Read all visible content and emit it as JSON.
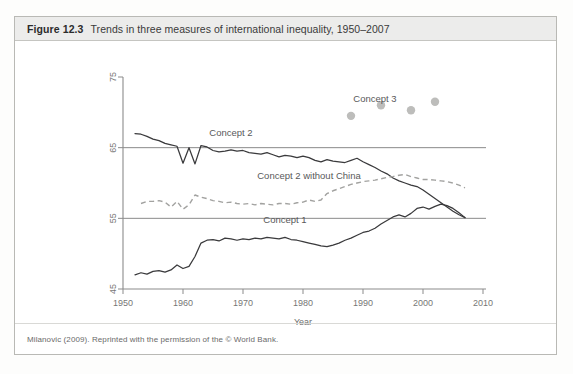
{
  "figure": {
    "number": "Figure 12.3",
    "title": "Trends in three measures of international inequality, 1950–2007",
    "source_note": "Milanovic (2009). Reprinted with the permission of the © World Bank."
  },
  "colors": {
    "header_band": "#ececeb",
    "frame_border": "#b9b9b5",
    "solid_line": "#3a3a3c",
    "dashed_line": "#a2a2a0",
    "concept3_dots": "#bdbdbb",
    "axis": "#8b8b8b",
    "text": "#59595a"
  },
  "chart_data": {
    "type": "line",
    "title": "Trends in three measures of international inequality, 1950–2007",
    "xlabel": "Year",
    "ylabel": "",
    "xlim": [
      1950,
      2010
    ],
    "ylim": [
      45,
      75
    ],
    "xticks": [
      1950,
      1960,
      1970,
      1980,
      1990,
      2000,
      2010
    ],
    "yticks": [
      45,
      55,
      65,
      75
    ],
    "grid": "horizontal lines at 55 and 65",
    "legend": "inline labels on plot",
    "annotations": [
      {
        "text": "Concept 2",
        "x": 1968,
        "y": 66.6
      },
      {
        "text": "Concept 2 without China",
        "x": 1981,
        "y": 60.6
      },
      {
        "text": "Concept 1",
        "x": 1977,
        "y": 54.3
      },
      {
        "text": "Concept 3",
        "x": 1992,
        "y": 71.5
      }
    ],
    "series": [
      {
        "name": "Concept 2",
        "style": "solid",
        "x": [
          1952,
          1953,
          1954,
          1955,
          1956,
          1957,
          1958,
          1959,
          1960,
          1961,
          1962,
          1963,
          1964,
          1965,
          1966,
          1967,
          1968,
          1969,
          1970,
          1971,
          1972,
          1973,
          1974,
          1975,
          1976,
          1977,
          1978,
          1979,
          1980,
          1981,
          1982,
          1983,
          1984,
          1985,
          1986,
          1987,
          1988,
          1989,
          1990,
          1991,
          1992,
          1993,
          1994,
          1995,
          1996,
          1997,
          1998,
          1999,
          2000,
          2001,
          2002,
          2003,
          2004,
          2005,
          2006,
          2007
        ],
        "y": [
          67.0,
          66.9,
          66.6,
          66.2,
          66.0,
          65.6,
          65.4,
          65.2,
          62.8,
          65.0,
          62.7,
          65.3,
          65.1,
          64.6,
          64.4,
          64.5,
          64.7,
          64.5,
          64.6,
          64.3,
          64.2,
          64.1,
          64.3,
          64.0,
          63.7,
          63.9,
          63.8,
          63.6,
          63.8,
          63.6,
          63.2,
          63.0,
          63.3,
          63.1,
          63.0,
          62.9,
          63.2,
          63.5,
          63.0,
          62.6,
          62.2,
          61.7,
          61.3,
          60.7,
          60.3,
          60.0,
          59.7,
          59.5,
          59.0,
          58.4,
          57.8,
          57.2,
          56.6,
          56.0,
          55.5,
          55.1
        ]
      },
      {
        "name": "Concept 2 without China",
        "style": "dashed",
        "x": [
          1953,
          1954,
          1955,
          1956,
          1957,
          1958,
          1959,
          1960,
          1961,
          1962,
          1963,
          1964,
          1965,
          1966,
          1967,
          1968,
          1969,
          1970,
          1971,
          1972,
          1973,
          1974,
          1975,
          1976,
          1977,
          1978,
          1979,
          1980,
          1981,
          1982,
          1983,
          1984,
          1985,
          1986,
          1987,
          1988,
          1989,
          1990,
          1991,
          1992,
          1993,
          1994,
          1995,
          1996,
          1997,
          1998,
          1999,
          2000,
          2001,
          2002,
          2003,
          2004,
          2005,
          2006,
          2007
        ],
        "y": [
          57.1,
          57.4,
          57.4,
          57.5,
          57.3,
          56.6,
          57.4,
          56.3,
          56.9,
          58.3,
          58.0,
          57.8,
          57.5,
          57.4,
          57.2,
          57.3,
          57.1,
          57.0,
          57.1,
          56.9,
          57.1,
          57.0,
          56.9,
          57.1,
          57.1,
          57.0,
          57.2,
          57.3,
          57.6,
          57.4,
          57.6,
          58.5,
          58.9,
          59.2,
          59.5,
          59.8,
          60.0,
          60.2,
          60.3,
          60.4,
          60.6,
          60.8,
          60.9,
          61.1,
          61.2,
          60.9,
          60.7,
          60.5,
          60.5,
          60.4,
          60.3,
          60.2,
          60.0,
          59.7,
          59.3
        ]
      },
      {
        "name": "Concept 1",
        "style": "solid",
        "x": [
          1952,
          1953,
          1954,
          1955,
          1956,
          1957,
          1958,
          1959,
          1960,
          1961,
          1962,
          1963,
          1964,
          1965,
          1966,
          1967,
          1968,
          1969,
          1970,
          1971,
          1972,
          1973,
          1974,
          1975,
          1976,
          1977,
          1978,
          1979,
          1980,
          1981,
          1982,
          1983,
          1984,
          1985,
          1986,
          1987,
          1988,
          1989,
          1990,
          1991,
          1992,
          1993,
          1994,
          1995,
          1996,
          1997,
          1998,
          1999,
          2000,
          2001,
          2002,
          2003,
          2004,
          2005,
          2006,
          2007
        ],
        "y": [
          47.0,
          47.3,
          47.1,
          47.5,
          47.6,
          47.4,
          47.7,
          48.4,
          47.9,
          48.2,
          49.6,
          51.5,
          51.9,
          52.0,
          51.8,
          52.2,
          52.1,
          51.9,
          52.1,
          52.0,
          52.2,
          52.1,
          52.3,
          52.2,
          52.1,
          52.3,
          52.0,
          51.9,
          51.7,
          51.5,
          51.3,
          51.1,
          51.0,
          51.2,
          51.5,
          51.9,
          52.2,
          52.6,
          53.0,
          53.2,
          53.6,
          54.2,
          54.7,
          55.2,
          55.5,
          55.2,
          55.7,
          56.4,
          56.6,
          56.3,
          56.7,
          57.0,
          56.8,
          56.4,
          55.8,
          55.1
        ]
      },
      {
        "name": "Concept 3",
        "style": "scatter",
        "x": [
          1988,
          1993,
          1998,
          2002
        ],
        "y": [
          69.5,
          71.0,
          70.3,
          71.5
        ]
      }
    ]
  }
}
